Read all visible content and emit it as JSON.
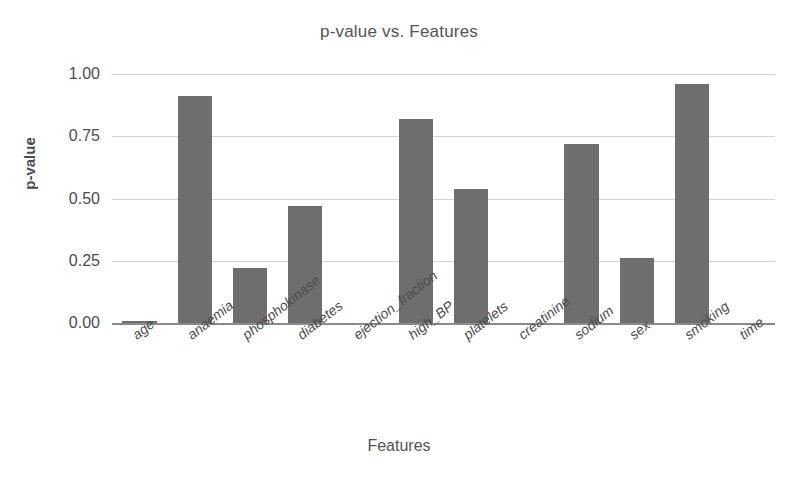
{
  "chart_data": {
    "type": "bar",
    "title": "p-value vs. Features",
    "xlabel": "Features",
    "ylabel": "p-value",
    "categories": [
      "age",
      "anaemia",
      "phosphokinase",
      "diabetes",
      "ejection_fraction",
      "high_BP",
      "platelets",
      "creatinine",
      "sodium",
      "sex",
      "smoking",
      "time"
    ],
    "values": [
      0.005,
      0.91,
      0.22,
      0.47,
      0.0,
      0.82,
      0.54,
      0.0,
      0.72,
      0.26,
      0.96,
      0.0
    ],
    "ylim": [
      0.0,
      1.0
    ],
    "yticks": [
      "0.00",
      "0.25",
      "0.50",
      "0.75",
      "1.00"
    ],
    "ytick_values": [
      0.0,
      0.25,
      0.5,
      0.75,
      1.0
    ],
    "grid": true,
    "legend": "none",
    "bar_color": "#6e6e6e",
    "grid_color": "#d3d3d3",
    "axis_color": "#8a8a8a"
  }
}
